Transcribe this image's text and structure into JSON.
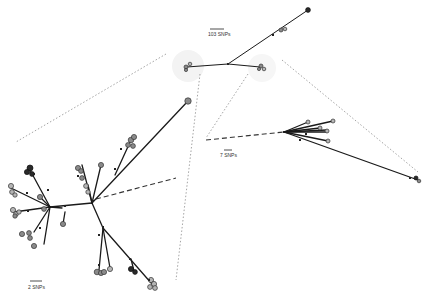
{
  "figure": {
    "type": "phylogenetic-network",
    "panels": [
      {
        "id": "overview",
        "scale_label": "103 SNPs",
        "position": "top-center"
      },
      {
        "id": "left-cluster",
        "scale_label": "2 SNPs",
        "position": "bottom-left"
      },
      {
        "id": "right-cluster",
        "scale_label": "7 SNPs",
        "position": "center-right"
      }
    ]
  },
  "colors": {
    "edge": "#1a1a1a",
    "node_grey": "#8a8a8a",
    "node_light": "#b5b5b5",
    "node_dark": "#2a2a2a",
    "connector": "#9a9a9a"
  }
}
